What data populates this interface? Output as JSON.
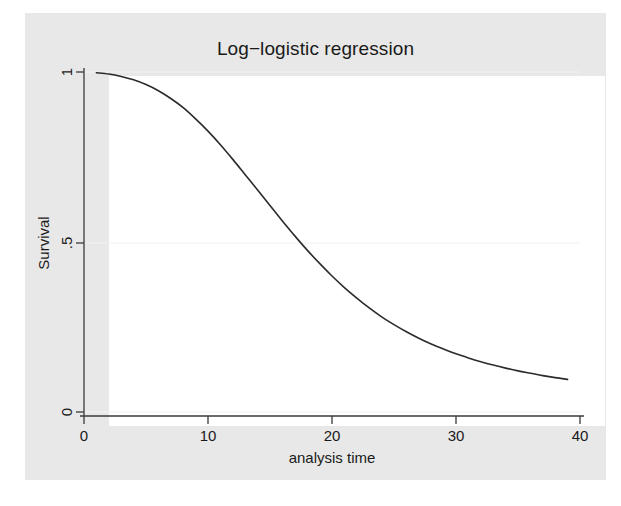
{
  "chart_data": {
    "type": "line",
    "title": "Log−logistic regression",
    "xlabel": "analysis time",
    "ylabel": "Survival",
    "xlim": [
      0,
      40
    ],
    "ylim": [
      0,
      1
    ],
    "xticks": [
      "0",
      "10",
      "20",
      "30",
      "40"
    ],
    "xtick_values": [
      0,
      10,
      20,
      30,
      40
    ],
    "yticks": [
      "0",
      ".5",
      "1"
    ],
    "ytick_values": [
      0,
      0.5,
      1
    ],
    "grid": "horizontal-only",
    "legend": "none",
    "series": [
      {
        "name": "Log-logistic survival",
        "color": "#2b2b2b",
        "x": [
          1,
          2,
          3,
          4,
          5,
          6,
          7,
          8,
          9,
          10,
          11,
          12,
          13,
          14,
          15,
          16,
          17,
          18,
          19,
          20,
          21,
          22,
          23,
          24,
          25,
          26,
          27,
          28,
          29,
          30,
          31,
          32,
          33,
          34,
          35,
          36,
          37,
          38,
          39
        ],
        "y": [
          0.998,
          0.994,
          0.987,
          0.977,
          0.963,
          0.945,
          0.922,
          0.895,
          0.862,
          0.826,
          0.786,
          0.743,
          0.698,
          0.653,
          0.607,
          0.562,
          0.518,
          0.476,
          0.437,
          0.4,
          0.366,
          0.335,
          0.306,
          0.28,
          0.257,
          0.236,
          0.217,
          0.2,
          0.185,
          0.171,
          0.159,
          0.148,
          0.138,
          0.129,
          0.121,
          0.114,
          0.107,
          0.101,
          0.096
        ]
      }
    ],
    "annotations": [],
    "model": {
      "form": "S(t) = 1 / (1 + (t/lambda)^p)",
      "lambda": 16.3,
      "p": 2.1
    }
  },
  "colors": {
    "graph_region_background": "#e8e8e8",
    "plot_region_background": "#ffffff",
    "curve": "#2b2b2b",
    "axis": "#3a3a3a",
    "gridline": "#f2f2f5",
    "text": "#1a1a1a"
  }
}
